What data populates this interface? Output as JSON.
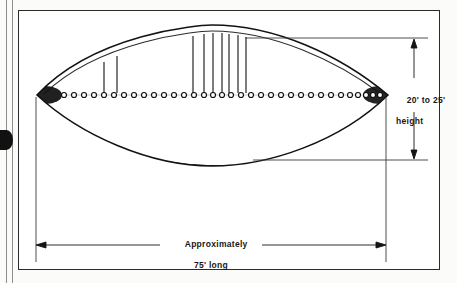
{
  "figure": {
    "name": "lenticular-airship-side-elevation",
    "kind": "technical-illustration"
  },
  "dimensions": {
    "height": {
      "line1": "20' to 25'",
      "line2": "height"
    },
    "length": {
      "line1": "Approximately",
      "line2": "75' long"
    }
  },
  "colors": {
    "ink": "#171717",
    "frame": "#2b2b2b",
    "paper": "#ffffff",
    "page": "#fbfbf9",
    "rule": "#4a4a4a",
    "shading": "#1a1a1a"
  },
  "geometry": {
    "hull": {
      "left_tip_x": 37,
      "right_tip_x": 388,
      "center_y": 95,
      "top_apex_y": 33,
      "bottom_apex_y": 160
    },
    "porthole_count": 34,
    "mast_count": 9
  }
}
